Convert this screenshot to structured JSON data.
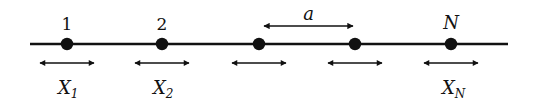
{
  "diagram": {
    "line": {
      "x1": 30,
      "x2": 508,
      "y": 44,
      "color": "#111111"
    },
    "particles": [
      {
        "x": 67,
        "top_label": "1",
        "bottom_label": "X",
        "bottom_sub": "1"
      },
      {
        "x": 162,
        "top_label": "2",
        "bottom_label": "X",
        "bottom_sub": "2"
      },
      {
        "x": 259,
        "top_label": "",
        "bottom_label": "",
        "bottom_sub": ""
      },
      {
        "x": 355,
        "top_label": "",
        "bottom_label": "",
        "bottom_sub": ""
      },
      {
        "x": 451,
        "top_label": "N",
        "bottom_label": "X",
        "bottom_sub": "N"
      }
    ],
    "spacing": {
      "label": "a",
      "x1": 262,
      "x2": 355,
      "y": 26
    },
    "displacement_arrow_halfwidth": 28,
    "displacement_arrow_y": 63
  }
}
